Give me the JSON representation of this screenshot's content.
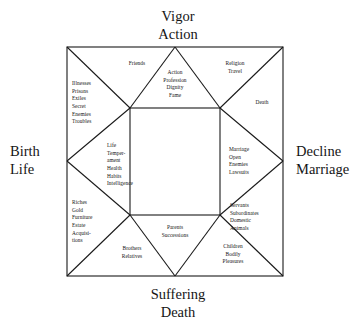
{
  "diagram": {
    "type": "square-astrological-house-chart",
    "cardinals": {
      "top": {
        "line1": "Vigor",
        "line2": "Action"
      },
      "bottom": {
        "line1": "Suffering",
        "line2": "Death"
      },
      "left": {
        "line1": "Birth",
        "line2": "Life"
      },
      "right": {
        "line1": "Decline",
        "line2": "Marriage"
      }
    },
    "houses": [
      {
        "id": "house-1",
        "position": "left-middle",
        "lines": [
          "Life",
          "Temper-",
          "ament",
          "Health",
          "Habits",
          "Intelligence"
        ]
      },
      {
        "id": "house-2",
        "position": "left-lower",
        "lines": [
          "Riches",
          "Gold",
          "Furniture",
          "Estate",
          "Acquisi-",
          "tions"
        ]
      },
      {
        "id": "house-3",
        "position": "bottom-left-corner",
        "lines": [
          "Brothers",
          "Relatives"
        ]
      },
      {
        "id": "house-4",
        "position": "bottom-middle",
        "lines": [
          "Parents",
          "Successions"
        ]
      },
      {
        "id": "house-5",
        "position": "bottom-right-corner",
        "lines": [
          "Children",
          "Bodily",
          "Pleasures"
        ]
      },
      {
        "id": "house-6",
        "position": "right-lower",
        "lines": [
          "Servants",
          "Subordinates",
          "Domestic",
          "Animals"
        ]
      },
      {
        "id": "house-7",
        "position": "right-middle",
        "lines": [
          "Marriage",
          "Open",
          "Enemies",
          "Lawsuits"
        ]
      },
      {
        "id": "house-8",
        "position": "right-upper",
        "lines": [
          "Death"
        ]
      },
      {
        "id": "house-9",
        "position": "top-right-corner",
        "lines": [
          "Religion",
          "Travel"
        ]
      },
      {
        "id": "house-10",
        "position": "top-middle",
        "lines": [
          "Action",
          "Profession",
          "Dignity",
          "Fame"
        ]
      },
      {
        "id": "house-11",
        "position": "top-left-corner",
        "lines": [
          "Friends"
        ]
      },
      {
        "id": "house-12",
        "position": "left-upper",
        "lines": [
          "Illnesses",
          "Prisons",
          "Exiles",
          "Secret",
          "Enemies",
          "Troubles"
        ]
      }
    ],
    "colors": {
      "background": "#ffffff",
      "line": "#1a1a1a",
      "text": "#141414"
    }
  }
}
